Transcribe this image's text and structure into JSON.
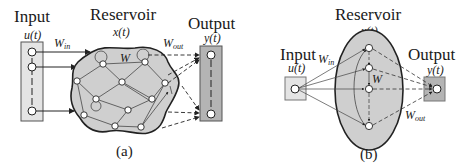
{
  "panel_a": {
    "input_label": "Input",
    "input_var": "u(t)",
    "reservoir_label": "Reservoir",
    "reservoir_var": "x(t)",
    "output_label": "Output",
    "output_var": "y(t)",
    "w_in": "W",
    "w_in_sub": "in",
    "w": "W",
    "w_out": "W",
    "w_out_sub": "out",
    "caption": "(a)"
  },
  "panel_b": {
    "input_label": "Input",
    "input_var": "u(t)",
    "reservoir_label": "Reservoir",
    "reservoir_var": "x(t)",
    "output_label": "Output",
    "output_var": "y(t)",
    "w_in": "W",
    "w_in_sub": "in",
    "w": "W",
    "w_out": "W",
    "w_out_sub": "out",
    "caption": "(b)"
  },
  "colors": {
    "input_box": "#e4e4e4",
    "reservoir_fill": "#cfcfcf",
    "output_box": "#b4b4b4",
    "stroke": "#222222"
  }
}
